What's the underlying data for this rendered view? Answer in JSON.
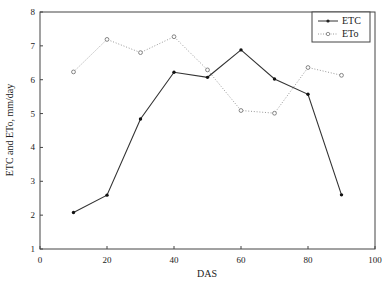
{
  "chart_data": {
    "type": "line",
    "title": "",
    "xlabel": "DAS",
    "ylabel": "ETC and ETo, mm/day",
    "xlim": [
      0,
      100
    ],
    "ylim": [
      1,
      8
    ],
    "xticks": [
      0,
      20,
      40,
      60,
      80,
      100
    ],
    "yticks": [
      1,
      2,
      3,
      4,
      5,
      6,
      7,
      8
    ],
    "grid": false,
    "legend_position": "top-right",
    "x": [
      10,
      20,
      30,
      40,
      50,
      60,
      70,
      80,
      90
    ],
    "series": [
      {
        "name": "ETC",
        "style": "solid",
        "marker": "filled-dot",
        "color": "#333333",
        "values": [
          2.08,
          2.59,
          4.84,
          6.22,
          6.07,
          6.88,
          6.02,
          5.57,
          2.6
        ]
      },
      {
        "name": "ETo",
        "style": "dotted",
        "marker": "open-circle",
        "color": "#9a9a9a",
        "values": [
          6.23,
          7.19,
          6.8,
          7.27,
          6.29,
          5.09,
          5.01,
          6.36,
          6.13
        ]
      }
    ]
  }
}
